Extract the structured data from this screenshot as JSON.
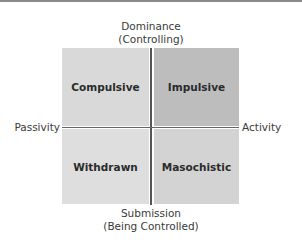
{
  "diagram": {
    "axes": {
      "top": {
        "line1": "Dominance",
        "line2": "(Controlling)"
      },
      "bottom": {
        "line1": "Submission",
        "line2": "(Being Controlled)"
      },
      "left": "Passivity",
      "right": "Activity"
    },
    "quadrants": [
      {
        "label": "Compulsive",
        "position": "top-left",
        "color": "#d9d9d9"
      },
      {
        "label": "Impulsive",
        "position": "top-right",
        "color": "#bdbdbd"
      },
      {
        "label": "Withdrawn",
        "position": "bottom-left",
        "color": "#dedede"
      },
      {
        "label": "Masochistic",
        "position": "bottom-right",
        "color": "#d3d3d3"
      }
    ]
  }
}
